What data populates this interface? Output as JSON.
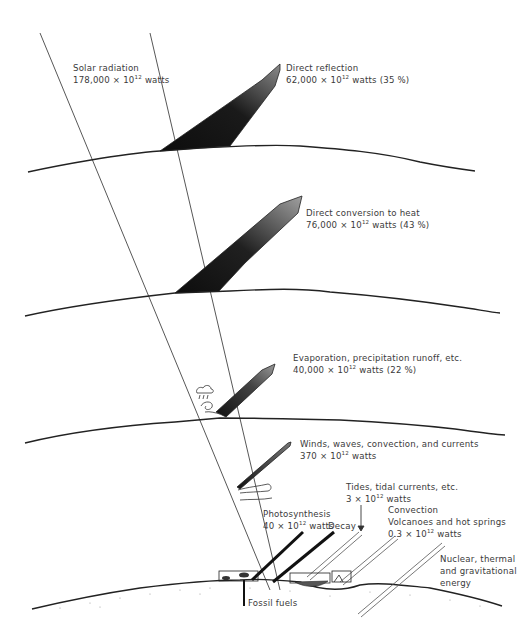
{
  "diagram": {
    "type": "energy-flow"
  },
  "labels": {
    "solar": {
      "title": "Solar radiation",
      "value": "178,000 × 10",
      "exp": "12",
      "unit": " watts"
    },
    "reflection": {
      "title": "Direct reflection",
      "value": "62,000 × 10",
      "exp": "12",
      "unit": " watts (35 %)"
    },
    "heat": {
      "title": "Direct conversion to heat",
      "value": "76,000 × 10",
      "exp": "12",
      "unit": " watts (43 %)"
    },
    "evaporation": {
      "title": "Evaporation, precipitation runoff, etc.",
      "value": "40,000 × 10",
      "exp": "12",
      "unit": " watts (22 %)"
    },
    "winds": {
      "title": "Winds, waves, convection, and currents",
      "value": "370 × 10",
      "exp": "12",
      "unit": " watts"
    },
    "tides": {
      "title": "Tides, tidal currents, etc.",
      "value": "3 × 10",
      "exp": "12",
      "unit": " watts"
    },
    "photosynthesis": {
      "title": "Photosynthesis",
      "value": "40 × 10",
      "exp": "12",
      "unit": " watts"
    },
    "decay": {
      "title": "Decay"
    },
    "convection": {
      "title": "Convection",
      "line2": "Volcanoes and hot springs",
      "value": "0.3 × 10",
      "exp": "12",
      "unit": " watts"
    },
    "nuclear": {
      "line1": "Nuclear, thermal",
      "line2": "and gravitational",
      "line3": "energy"
    },
    "fossil": {
      "title": "Fossil fuels"
    }
  },
  "colors": {
    "ink": "#222222",
    "arrow_dark": "#111111",
    "arrow_light": "#9a9a9a",
    "text": "#3a3a3a"
  }
}
